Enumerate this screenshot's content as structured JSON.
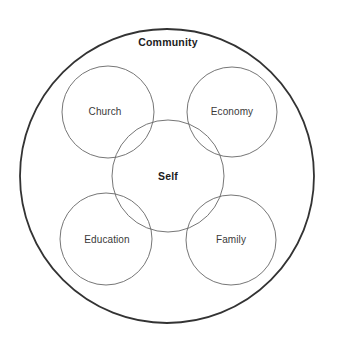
{
  "diagram": {
    "type": "venn-concentric",
    "background_color": "#ffffff",
    "outer": {
      "label": "Community",
      "stroke_color": "#333333",
      "stroke_width": 1.8,
      "cx": 167,
      "cy": 176,
      "r": 147,
      "label_x": 168,
      "label_y": 46,
      "bold": true
    },
    "center": {
      "label": "Self",
      "stroke_color": "#666666",
      "stroke_width": 0.9,
      "cx": 168,
      "cy": 176,
      "r": 56,
      "label_x": 168,
      "label_y": 180,
      "bold": true
    },
    "satellites": [
      {
        "name": "church",
        "label": "Church",
        "cx": 108,
        "cy": 112,
        "r": 46,
        "label_x": 105,
        "label_y": 115,
        "stroke_color": "#666666",
        "stroke_width": 0.9
      },
      {
        "name": "economy",
        "label": "Economy",
        "cx": 232,
        "cy": 112,
        "r": 45,
        "label_x": 232,
        "label_y": 115,
        "stroke_color": "#666666",
        "stroke_width": 0.9
      },
      {
        "name": "education",
        "label": "Education",
        "cx": 106,
        "cy": 239,
        "r": 46,
        "label_x": 107,
        "label_y": 243,
        "stroke_color": "#666666",
        "stroke_width": 0.9
      },
      {
        "name": "family",
        "label": "Family",
        "cx": 231,
        "cy": 240,
        "r": 45,
        "label_x": 231,
        "label_y": 243,
        "stroke_color": "#666666",
        "stroke_width": 0.9
      }
    ]
  }
}
